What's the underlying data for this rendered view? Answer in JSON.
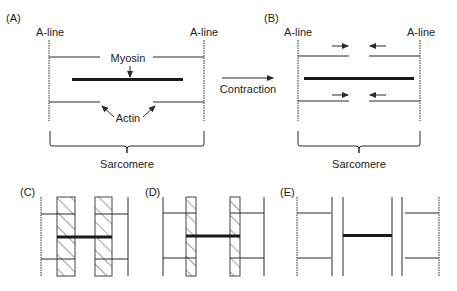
{
  "panels": {
    "A": {
      "label": "(A)",
      "a_line_left": "A-line",
      "a_line_right": "A-line",
      "myosin": "Myosin",
      "actin": "Actin",
      "sarcomere": "Sarcomere"
    },
    "B": {
      "label": "(B)",
      "a_line_left": "A-line",
      "a_line_right": "A-line",
      "sarcomere": "Sarcomere"
    },
    "C": {
      "label": "(C)"
    },
    "D": {
      "label": "(D)"
    },
    "E": {
      "label": "(E)"
    }
  },
  "transition": {
    "label": "Contraction"
  },
  "colors": {
    "line": "#2a2a2a",
    "background": "#ffffff"
  }
}
